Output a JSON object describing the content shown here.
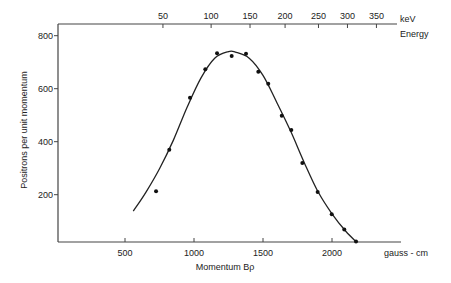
{
  "chart_data": {
    "type": "scatter",
    "title": "",
    "xlabel": "Momentum  Bρ",
    "xunit": "gauss - cm",
    "ylabel": "Positrons per unit momentum",
    "top_axis_label": "Energy",
    "top_axis_unit": "keV",
    "xlim": [
      0,
      2450
    ],
    "ylim": [
      20,
      840
    ],
    "x_ticks": [
      500,
      1000,
      1500,
      2000
    ],
    "y_ticks": [
      200,
      400,
      600,
      800
    ],
    "top_ticks": [
      {
        "label": "50",
        "momentum": 775
      },
      {
        "label": "100",
        "momentum": 1124
      },
      {
        "label": "150",
        "momentum": 1406
      },
      {
        "label": "200",
        "momentum": 1660
      },
      {
        "label": "250",
        "momentum": 1902
      },
      {
        "label": "300",
        "momentum": 2112
      },
      {
        "label": "350",
        "momentum": 2322
      }
    ],
    "grid": false,
    "legend": null,
    "series": [
      {
        "name": "Measured points",
        "style": "points",
        "x": [
          725,
          821,
          971,
          1082,
          1167,
          1273,
          1377,
          1466,
          1538,
          1636,
          1705,
          1785,
          1896,
          1998,
          2089,
          2174
        ],
        "y": [
          213,
          370,
          566,
          673,
          734,
          723,
          732,
          664,
          619,
          498,
          444,
          320,
          210,
          126,
          69,
          23
        ]
      },
      {
        "name": "Fitted curve",
        "style": "line",
        "x": [
          560,
          650,
          750,
          850,
          950,
          1050,
          1150,
          1250,
          1300,
          1400,
          1500,
          1600,
          1700,
          1800,
          1900,
          2000,
          2100,
          2180
        ],
        "y": [
          138,
          208,
          298,
          405,
          530,
          640,
          715,
          740,
          738,
          715,
          650,
          548,
          440,
          320,
          210,
          128,
          62,
          20
        ]
      }
    ]
  }
}
